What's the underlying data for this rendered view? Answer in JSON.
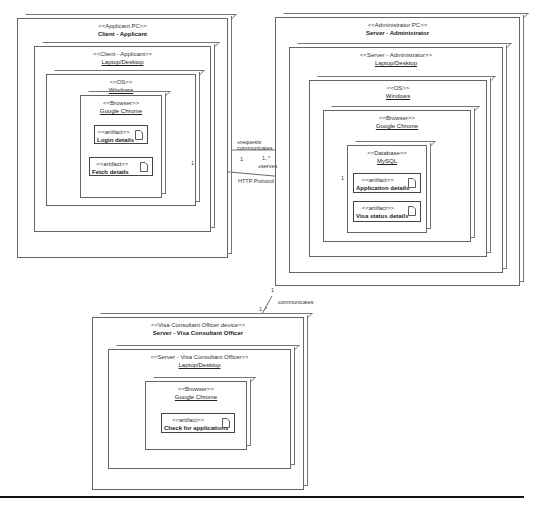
{
  "diagram": {
    "type": "UML deployment diagram",
    "nodes": {
      "client": {
        "stereotype": "<<Applicant PC>>",
        "name": "Client - Applicant",
        "laptop": {
          "stereotype": "<<Client - Applicant>>",
          "name": "Laptop/Desktop"
        },
        "os": {
          "stereotype": "<<OS>>",
          "name": "Windows"
        },
        "browser": {
          "stereotype": "<<Browser>>",
          "name": "Google Chrome"
        },
        "artifacts": [
          {
            "stereotype": "<<artifact>>",
            "name": "Login details"
          },
          {
            "stereotype": "<<artifact>>",
            "name": "Fetch details"
          }
        ]
      },
      "server": {
        "stereotype": "<<Administrator PC>>",
        "name": "Server - Administrator",
        "laptop": {
          "stereotype": "<<Server - Administrator>>",
          "name": "Laptop/Desktop"
        },
        "os": {
          "stereotype": "<<OS>>",
          "name": "Windows"
        },
        "browser": {
          "stereotype": "<<Browser>>",
          "name": "Google Chrome"
        },
        "database": {
          "stereotype": "<<Database>>",
          "name": "MySQL"
        },
        "artifacts": [
          {
            "stereotype": "<<artifact>>",
            "name": "Application details"
          },
          {
            "stereotype": "<<artifact>>",
            "name": "Visa status details"
          }
        ]
      },
      "officer": {
        "stereotype": "<<Visa Consultant Officer device>>",
        "name": "Server - Visa Consultant Officer",
        "laptop": {
          "stereotype": "<<Server - Visa Consultant Officer>>",
          "name": "Laptop/Desktop"
        },
        "browser": {
          "stereotype": "<<Browser>>",
          "name": "Google Chrome"
        },
        "artifacts": [
          {
            "stereotype": "<<artifact>>",
            "name": "Check for applications"
          }
        ]
      }
    },
    "connections": {
      "client_server": {
        "label_top1": "«requests",
        "label_top2": "communicates",
        "mult_left": "1",
        "mult_right": "1..*",
        "label_serves": "«serves",
        "protocol": "HTTP Protocol",
        "end_client": "1",
        "end_server": "1"
      },
      "server_officer": {
        "label": "communicates",
        "mult_server": "1",
        "mult_officer": "1..*"
      }
    }
  }
}
